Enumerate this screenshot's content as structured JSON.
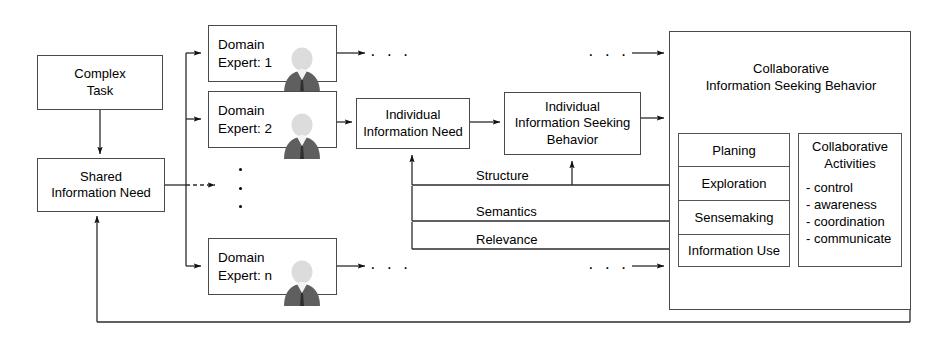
{
  "diagram": {
    "nodes": {
      "complex_task": "Complex\nTask",
      "shared_need": "Shared\nInformation Need",
      "expert1": "Domain\nExpert: 1",
      "expert2": "Domain\nExpert: 2",
      "expertn": "Domain\nExpert: n",
      "individual_need": "Individual\nInformation Need",
      "individual_behavior": "Individual\nInformation Seeking\nBehavior",
      "cisb_title": "Collaborative\nInformation Seeking Behavior"
    },
    "edge_labels": {
      "structure": "Structure",
      "semantics": "Semantics",
      "relevance": "Relevance"
    },
    "ellipsis": {
      "horizontal": "· · ·",
      "top_left": "· · ·",
      "top_right": "· · ·",
      "bottom_left": "· · ·",
      "bottom_right": "· · ·"
    },
    "planning_column": {
      "header": "Planing",
      "items": [
        "Exploration",
        "Sensemaking",
        "Information Use"
      ]
    },
    "activities_column": {
      "header": "Collaborative\nActivities",
      "items": [
        "- control",
        "- awareness",
        "- coordination",
        "- communicate"
      ]
    },
    "colors": {
      "stroke": "#3f3f3f",
      "background": "#ffffff",
      "text": "#000000",
      "person_body": "#5f5f5f",
      "person_head": "#d9d9d9",
      "person_shirt": "#f2f2f2"
    }
  }
}
